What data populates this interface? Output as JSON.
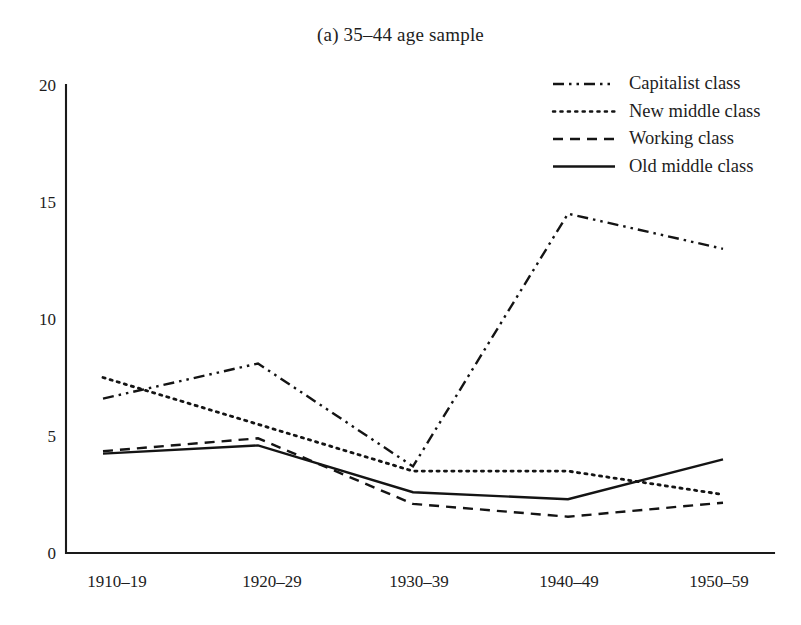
{
  "figure": {
    "title": "(a) 35–44 age sample",
    "background": "#ffffff",
    "ink": "#141414"
  },
  "chart_data": {
    "type": "line",
    "title": "(a) 35–44 age sample",
    "xlabel": "",
    "ylabel": "",
    "categories": [
      "1910–19",
      "1920–29",
      "1930–39",
      "1940–49",
      "1950–59"
    ],
    "ylim": [
      0,
      20
    ],
    "yticks": [
      0,
      5,
      10,
      15,
      20
    ],
    "ytick_labels": [
      "0",
      "5",
      "10",
      "15",
      "20"
    ],
    "grid": false,
    "legend_position": "top-right",
    "series": [
      {
        "name": "Capitalist class",
        "linestyle": "dashdotdot",
        "color": "#141414",
        "values": [
          6.6,
          8.1,
          3.7,
          14.5,
          13.0
        ]
      },
      {
        "name": "New middle class",
        "linestyle": "dotted",
        "color": "#141414",
        "values": [
          7.5,
          5.5,
          3.5,
          3.5,
          2.5
        ]
      },
      {
        "name": "Working class",
        "linestyle": "dashed",
        "color": "#141414",
        "values": [
          4.35,
          4.9,
          2.1,
          1.55,
          2.15
        ]
      },
      {
        "name": "Old middle class",
        "linestyle": "solid",
        "color": "#141414",
        "values": [
          4.25,
          4.6,
          2.6,
          2.3,
          4.0
        ]
      }
    ]
  },
  "legend": {
    "items": [
      {
        "label": "Capitalist class",
        "linestyle": "dashdotdot"
      },
      {
        "label": "New middle class",
        "linestyle": "dotted"
      },
      {
        "label": "Working class",
        "linestyle": "dashed"
      },
      {
        "label": "Old middle class",
        "linestyle": "solid"
      }
    ]
  },
  "axes": {
    "y_tick_labels": [
      "20",
      "15",
      "10",
      "5",
      "0"
    ],
    "x_tick_labels": [
      "1910–19",
      "1920–29",
      "1930–39",
      "1940–49",
      "1950–59"
    ]
  }
}
